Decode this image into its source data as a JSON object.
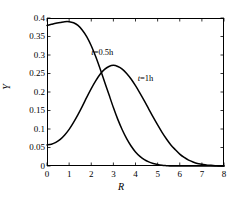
{
  "chart_data": {
    "type": "line",
    "title": "",
    "subtitle": "",
    "xlabel": "R",
    "ylabel": "Y",
    "xlim": [
      0,
      8
    ],
    "ylim": [
      0,
      0.4
    ],
    "grid": false,
    "legend_position": "inline-annotations",
    "xticks": [
      "0",
      "1",
      "2",
      "3",
      "4",
      "5",
      "6",
      "7",
      "8"
    ],
    "xtick_values": [
      0,
      1,
      2,
      3,
      4,
      5,
      6,
      7,
      8
    ],
    "yticks": [
      "0",
      "0.05",
      "0.1",
      "0.15",
      "0.2",
      "0.25",
      "0.3",
      "0.35",
      "0.4"
    ],
    "ytick_values": [
      0,
      0.05,
      0.1,
      0.15,
      0.2,
      0.25,
      0.3,
      0.35,
      0.4
    ],
    "line_color": "#000000",
    "axis_color": "#000000",
    "background": "#ffffff",
    "annotations": [
      {
        "text": "t=0.5h",
        "italic_prefix": "t",
        "rest": "=0.5h",
        "x": 2.0,
        "y": 0.305
      },
      {
        "text": "t=1h",
        "italic_prefix": "t",
        "rest": "=1h",
        "x": 4.1,
        "y": 0.235
      }
    ],
    "series": [
      {
        "name": "t=0.5h",
        "x": [
          0.0,
          0.2,
          0.4,
          0.6,
          0.8,
          1.0,
          1.2,
          1.4,
          1.6,
          1.8,
          2.0,
          2.2,
          2.4,
          2.6,
          2.8,
          3.0,
          3.2,
          3.4,
          3.6,
          3.8,
          4.0,
          4.2,
          4.4,
          4.6,
          4.8,
          5.0,
          5.2,
          5.4,
          5.6,
          5.8,
          6.0,
          8.0
        ],
        "values": [
          0.38,
          0.383,
          0.386,
          0.388,
          0.39,
          0.39,
          0.387,
          0.38,
          0.367,
          0.349,
          0.325,
          0.296,
          0.263,
          0.228,
          0.193,
          0.158,
          0.126,
          0.098,
          0.074,
          0.054,
          0.038,
          0.026,
          0.017,
          0.011,
          0.007,
          0.004,
          0.002,
          0.001,
          0.0,
          0.0,
          0.0,
          0.0
        ]
      },
      {
        "name": "t=1h",
        "x": [
          0.0,
          0.2,
          0.4,
          0.6,
          0.8,
          1.0,
          1.2,
          1.4,
          1.6,
          1.8,
          2.0,
          2.2,
          2.4,
          2.6,
          2.8,
          3.0,
          3.2,
          3.4,
          3.6,
          3.8,
          4.0,
          4.2,
          4.4,
          4.6,
          4.8,
          5.0,
          5.2,
          5.4,
          5.6,
          5.8,
          6.0,
          6.2,
          6.4,
          6.6,
          6.8,
          7.0,
          7.2,
          7.4,
          7.6,
          7.8,
          8.0
        ],
        "values": [
          0.057,
          0.059,
          0.064,
          0.072,
          0.084,
          0.099,
          0.118,
          0.139,
          0.162,
          0.186,
          0.209,
          0.23,
          0.248,
          0.261,
          0.269,
          0.272,
          0.269,
          0.262,
          0.25,
          0.235,
          0.217,
          0.197,
          0.176,
          0.154,
          0.132,
          0.111,
          0.091,
          0.073,
          0.057,
          0.044,
          0.032,
          0.023,
          0.016,
          0.011,
          0.007,
          0.005,
          0.003,
          0.002,
          0.001,
          0.0,
          0.0
        ]
      }
    ]
  }
}
